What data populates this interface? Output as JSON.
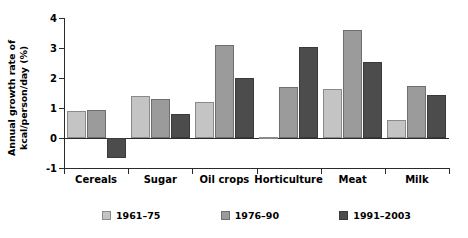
{
  "chart_data": {
    "type": "bar",
    "title": "",
    "xlabel": "",
    "ylabel": "Annual growth rate of\nkcal/person/day (%)",
    "ylim": [
      -1,
      4
    ],
    "yticks": [
      -1,
      0,
      1,
      2,
      3,
      4
    ],
    "ytick_labels": [
      "-1",
      "0",
      "1",
      "2",
      "3",
      "4"
    ],
    "grid": false,
    "legend_position": "bottom",
    "categories": [
      "Cereals",
      "Sugar",
      "Oil crops",
      "Horticulture",
      "Meat",
      "Milk"
    ],
    "series": [
      {
        "name": "1961–75",
        "color": "#c4c4c4",
        "values": [
          0.9,
          1.4,
          1.2,
          0.05,
          1.65,
          0.6
        ]
      },
      {
        "name": "1976–90",
        "color": "#9b9b9b",
        "values": [
          0.95,
          1.3,
          3.1,
          1.7,
          3.6,
          1.75
        ]
      },
      {
        "name": "1991–2003",
        "color": "#4c4c4c",
        "values": [
          -0.65,
          0.8,
          2.0,
          3.05,
          2.55,
          1.45
        ]
      }
    ]
  },
  "legend": {
    "items": [
      {
        "label": "1961–75",
        "swatch": "legend-swatch-1961-75"
      },
      {
        "label": "1976–90",
        "swatch": "legend-swatch-1976-90"
      },
      {
        "label": "1991–2003",
        "swatch": "legend-swatch-1991-2003"
      }
    ]
  }
}
